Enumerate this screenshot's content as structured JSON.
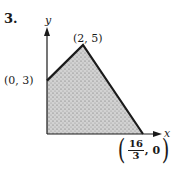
{
  "problem_number": "3.",
  "axes": {
    "x_label": "x",
    "y_label": "y"
  },
  "region": {
    "description": "shaded feasible region (quadrilateral)",
    "vertices": [
      {
        "x": 0,
        "y": 0,
        "label": ""
      },
      {
        "x": 0,
        "y": 3,
        "label": "(0, 3)"
      },
      {
        "x": 2,
        "y": 5,
        "label": "(2, 5)"
      },
      {
        "x": 5.3333,
        "y": 0,
        "label": "(16/3, 0)"
      }
    ],
    "fill_color": "#9a9a9a",
    "edge_color": "#1a1a1a"
  },
  "labels": {
    "p03": "(0, 3)",
    "p25": "(2, 5)",
    "frac_num": "16",
    "frac_den": "3",
    "frac_tail": ", 0",
    "open_paren": "(",
    "close_paren": ")"
  }
}
